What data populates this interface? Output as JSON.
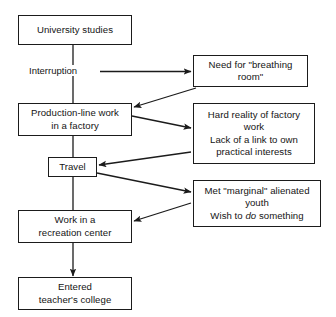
{
  "diagram": {
    "background_color": "#ffffff",
    "line_color": "#1b1b1b",
    "text_color": "#141414",
    "nodes": [
      {
        "id": "university",
        "label": "University studies"
      },
      {
        "id": "breathing",
        "label": "Need for \"breathing\nroom\""
      },
      {
        "id": "production",
        "label": "Production-line work\nin a factory"
      },
      {
        "id": "hard",
        "label": "Hard reality of factory\nwork\nLack of a link to own\npractical interests"
      },
      {
        "id": "travel",
        "label": "Travel"
      },
      {
        "id": "marginal_l1",
        "label": "Met \"marginal\" alienated"
      },
      {
        "id": "marginal_l2",
        "label": "youth"
      },
      {
        "id": "marginal_l3a",
        "label": "Wish to "
      },
      {
        "id": "marginal_l3b",
        "label": "do"
      },
      {
        "id": "marginal_l3c",
        "label": " something"
      },
      {
        "id": "recreation",
        "label": "Work in a\nrecreation center"
      },
      {
        "id": "college",
        "label": "Entered\nteacher's college"
      }
    ],
    "edge_labels": [
      {
        "id": "interruption",
        "label": "Interruption"
      }
    ]
  }
}
